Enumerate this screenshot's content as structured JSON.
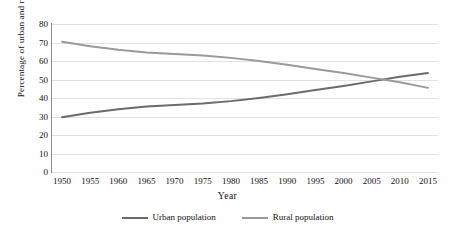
{
  "chart_data": {
    "type": "line",
    "title": "",
    "xlabel": "Year",
    "ylabel": "Percentage of urban and rural population",
    "x": [
      1950,
      1955,
      1960,
      1965,
      1970,
      1975,
      1980,
      1985,
      1990,
      1995,
      2000,
      2005,
      2010,
      2015
    ],
    "xlim": [
      1950,
      2015
    ],
    "ylim": [
      0,
      80
    ],
    "yticks": [
      0,
      10,
      20,
      30,
      40,
      50,
      60,
      70,
      80
    ],
    "xticks": [
      "1950",
      "1955",
      "1960",
      "1965",
      "1970",
      "1975",
      "1980",
      "1985",
      "1990",
      "1995",
      "2000",
      "2005",
      "2010",
      "2015"
    ],
    "grid": "horizontal",
    "legend_position": "bottom",
    "series": [
      {
        "name": "Urban population",
        "color": "#6b6b6b",
        "values": [
          29.6,
          32.0,
          33.9,
          35.4,
          36.2,
          37.0,
          38.3,
          40.0,
          42.0,
          44.3,
          46.5,
          49.0,
          51.5,
          53.5
        ]
      },
      {
        "name": "Rural population",
        "color": "#9a9a9a",
        "values": [
          70.4,
          68.0,
          66.1,
          64.6,
          63.8,
          63.0,
          61.7,
          60.0,
          58.0,
          55.7,
          53.5,
          51.0,
          48.5,
          45.5
        ]
      }
    ],
    "legend": [
      "Urban population",
      "Rural population"
    ],
    "colors": {
      "urban": "#6b6b6b",
      "rural": "#9a9a9a",
      "gridline": "#e2e2e2",
      "axis": "#8f8f8f",
      "background": "#ffffff",
      "text": "#111111"
    }
  }
}
